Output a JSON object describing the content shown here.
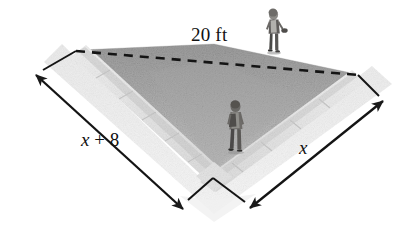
{
  "figure": {
    "type": "geometry-diagram",
    "background_color": "#ffffff",
    "line_color": "#1a1a1a",
    "grass_color": "#b4b4b4",
    "pavement_color": "#e6e6e6"
  },
  "labels": {
    "hypotenuse": "20 ft",
    "left_leg": "x + 8",
    "left_leg_var": "x",
    "left_leg_op": " + ",
    "left_leg_const": "8",
    "right_leg": "x"
  },
  "annotations": {
    "dashed_line_name": "hypotenuse-dashed-line",
    "left_dimension_name": "left-leg-dimension-arrow",
    "right_dimension_name": "right-leg-dimension-arrow"
  },
  "people": [
    {
      "name": "person-upper-right",
      "description": "person walking on the far right path"
    },
    {
      "name": "person-center",
      "description": "person with backpack walking near the apex"
    }
  ],
  "geometry": {
    "apex": [
      213,
      178
    ],
    "left_end": [
      76,
      52
    ],
    "right_end": [
      358,
      75
    ],
    "left_arrow_tip": [
      36,
      75
    ],
    "right_arrow_tip": [
      383,
      101
    ],
    "bottom_left_arrow_tip": [
      183,
      209
    ],
    "bottom_right_arrow_tip": [
      250,
      208
    ]
  }
}
